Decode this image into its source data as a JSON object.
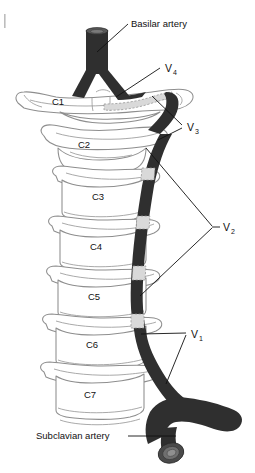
{
  "figure": {
    "background_color": "#ffffff",
    "artery_color": "#3a3a3a",
    "bone_outline_color": "#8e8e8e",
    "hidden_segment_color": "#d9d9d9"
  },
  "labels": {
    "basilar_artery": "Basilar artery",
    "subclavian_artery": "Subclavian artery"
  },
  "segments": [
    {
      "id": "v4",
      "letter": "V",
      "sub": "4"
    },
    {
      "id": "v3",
      "letter": "V",
      "sub": "3"
    },
    {
      "id": "v2",
      "letter": "V",
      "sub": "2"
    },
    {
      "id": "v1",
      "letter": "V",
      "sub": "1"
    }
  ],
  "vertebrae": [
    {
      "id": "c1",
      "label": "C1"
    },
    {
      "id": "c2",
      "label": "C2"
    },
    {
      "id": "c3",
      "label": "C3"
    },
    {
      "id": "c4",
      "label": "C4"
    },
    {
      "id": "c5",
      "label": "C5"
    },
    {
      "id": "c6",
      "label": "C6"
    },
    {
      "id": "c7",
      "label": "C7"
    }
  ]
}
